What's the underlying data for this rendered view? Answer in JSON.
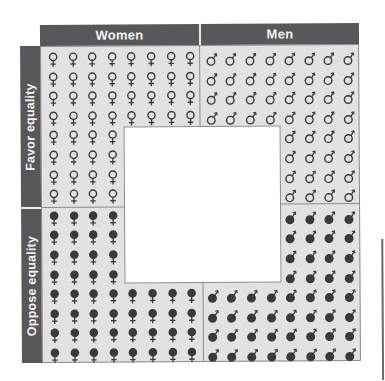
{
  "columns": [
    {
      "label": "Women",
      "symbol": "female"
    },
    {
      "label": "Men",
      "symbol": "male"
    }
  ],
  "rows": [
    {
      "label": "Favor equality",
      "fill": "open"
    },
    {
      "label": "Oppose equality",
      "fill": "filled"
    }
  ],
  "colors": {
    "band": "#58585a",
    "band_text": "#f2f2f2",
    "grid_bg": "#e2e2e2",
    "glyph": "#3a3a3a",
    "hole": "#ffffff"
  },
  "chart_data": {
    "type": "pictogram",
    "title": "",
    "column_labels": [
      "Women",
      "Men"
    ],
    "row_labels": [
      "Favor equality",
      "Oppose equality"
    ],
    "cells": [
      {
        "column": "Women",
        "row": "Favor equality",
        "count": 48,
        "symbol": "♀ open"
      },
      {
        "column": "Men",
        "row": "Favor equality",
        "count": 48,
        "symbol": "♂ open"
      },
      {
        "column": "Women",
        "row": "Oppose equality",
        "count": 48,
        "symbol": "♀ filled"
      },
      {
        "column": "Men",
        "row": "Oppose equality",
        "count": 48,
        "symbol": "♂ filled"
      }
    ],
    "grid_per_quadrant": [
      8,
      8
    ],
    "note": "Each quadrant is an 8x8 grid with one 4x4 block removed toward the center, leaving a central white square"
  }
}
